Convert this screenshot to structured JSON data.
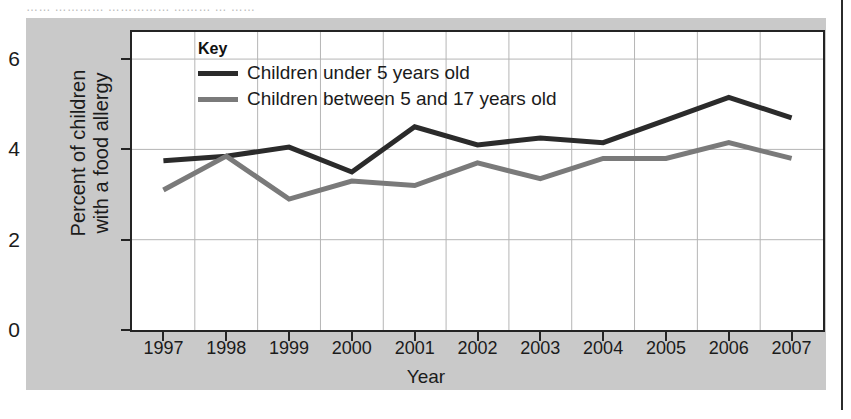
{
  "scan": {
    "top_cut_text": "……   …………  ……………  ……… …  ……"
  },
  "legend": {
    "title": "Key",
    "entries": [
      {
        "label": "Children under 5 years old",
        "color": "#2b2b2b"
      },
      {
        "label": "Children between 5 and 17 years old",
        "color": "#7a7a7a"
      }
    ]
  },
  "axes": {
    "y_title": "Percent of children\nwith a food allergy",
    "y_ticks": [
      "0",
      "2",
      "4",
      "6"
    ],
    "x_title": "Year"
  },
  "chart_data": {
    "type": "line",
    "title": "",
    "xlabel": "Year",
    "ylabel": "Percent of children with a food allergy",
    "categories": [
      "1997",
      "1998",
      "1999",
      "2000",
      "2001",
      "2002",
      "2003",
      "2004",
      "2005",
      "2006",
      "2007"
    ],
    "x": [
      1997,
      1998,
      1999,
      2000,
      2001,
      2002,
      2003,
      2004,
      2005,
      2006,
      2007
    ],
    "ylim": [
      0,
      6.6
    ],
    "y_ticks": [
      0,
      2,
      4,
      6
    ],
    "xlim": [
      1996.5,
      2007.5
    ],
    "grid": true,
    "legend_position": "top-left-inside",
    "series": [
      {
        "name": "Children under 5 years old",
        "color": "#2b2b2b",
        "values": [
          3.75,
          3.85,
          4.05,
          3.5,
          4.5,
          4.1,
          4.25,
          4.15,
          4.65,
          5.15,
          4.7
        ]
      },
      {
        "name": "Children between 5 and 17 years old",
        "color": "#7a7a7a",
        "values": [
          3.1,
          3.85,
          2.9,
          3.3,
          3.2,
          3.7,
          3.35,
          3.8,
          3.8,
          4.15,
          3.8
        ]
      }
    ]
  }
}
